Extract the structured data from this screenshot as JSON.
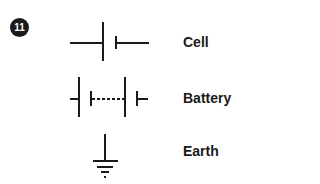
{
  "badge": {
    "number": "11"
  },
  "symbols": [
    {
      "name": "cell",
      "label": "Cell"
    },
    {
      "name": "battery",
      "label": "Battery"
    },
    {
      "name": "earth",
      "label": "Earth"
    }
  ],
  "colors": {
    "ink": "#1a1a1a",
    "background": "#ffffff"
  }
}
